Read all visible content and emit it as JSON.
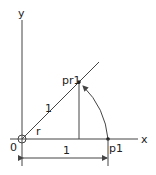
{
  "diagram": {
    "labels": {
      "y_axis": "y",
      "x_axis": "x",
      "origin": "0",
      "point_rotated": "pr1",
      "point_start": "p1",
      "radius_length": "1",
      "angle": "r",
      "dimension_length": "1"
    },
    "colors": {
      "line": "#444444",
      "text": "#222222",
      "background": "#ffffff"
    }
  }
}
